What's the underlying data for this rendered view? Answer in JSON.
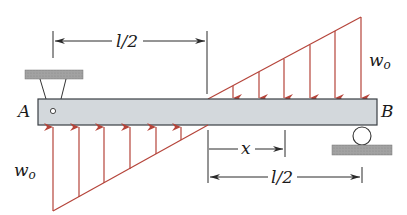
{
  "diagram": {
    "type": "beam-loading",
    "labels": {
      "support_left": "A",
      "support_right": "B",
      "load_top": "w",
      "load_top_sub": "o",
      "load_bottom": "w",
      "load_bottom_sub": "o",
      "dim_top": "l/2",
      "dim_bottom": "l/2",
      "dim_x": "x"
    },
    "colors": {
      "load": "#b5443a",
      "beam_fill": "#d3d8dc",
      "beam_stroke": "#3a3f44",
      "ground_fill": "#9a9a9a",
      "dimension": "#2a2a2a"
    },
    "supports": {
      "left": "pin-hanger",
      "right": "roller"
    }
  }
}
